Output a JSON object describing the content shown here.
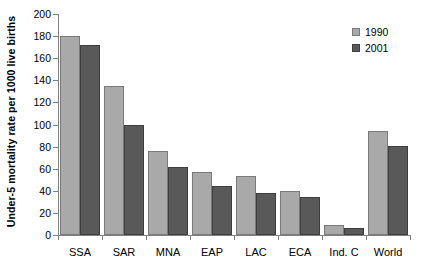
{
  "chart_data": {
    "type": "bar",
    "title": "",
    "xlabel": "",
    "ylabel": "Under-5 mortality rate per 1000 live births",
    "ylim": [
      0,
      200
    ],
    "ytick_step": 20,
    "yticks": [
      0,
      20,
      40,
      60,
      80,
      100,
      120,
      140,
      160,
      180,
      200
    ],
    "ytick_labels": [
      "0",
      "20",
      "40",
      "60",
      "80",
      "100",
      "120",
      "140",
      "160",
      "180",
      "200"
    ],
    "grid": false,
    "legend_position": "top-right",
    "categories": [
      "SSA",
      "SAR",
      "MNA",
      "EAP",
      "LAC",
      "ECA",
      "Ind. C",
      "World"
    ],
    "series": [
      {
        "name": "1990",
        "color": "#a9a9a9",
        "values": [
          180,
          135,
          76,
          57,
          53,
          40,
          9,
          94
        ]
      },
      {
        "name": "2001",
        "color": "#595959",
        "values": [
          172,
          100,
          62,
          44,
          38,
          34,
          6,
          81
        ]
      }
    ]
  }
}
